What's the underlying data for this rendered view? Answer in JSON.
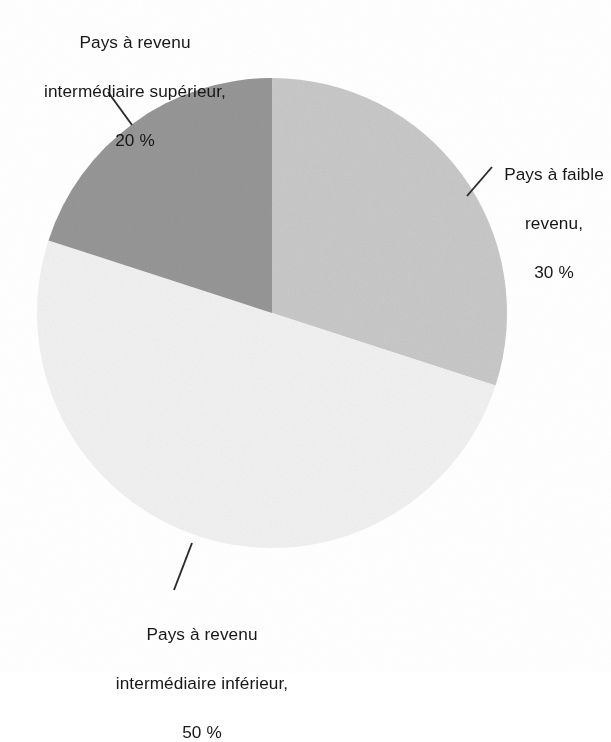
{
  "figure": {
    "type": "pie-chart",
    "background_color": "#ffffff",
    "text_color": "#171717"
  },
  "chart_data": {
    "type": "pie",
    "title": "",
    "subtitle": "",
    "xlabel": "",
    "ylabel": "",
    "legend_position": "none",
    "grid": false,
    "units": "%",
    "categories": [
      "Pays à faible revenu",
      "Pays à revenu intermédiaire inférieur",
      "Pays à revenu intermédiaire supérieur"
    ],
    "values": [
      30,
      50,
      20
    ],
    "labels": [
      "30 %",
      "50 %",
      "20 %"
    ],
    "colors": [
      "#bdbdbd",
      "#efefef",
      "#808080"
    ],
    "start_angle_deg": 0,
    "direction": "clockwise",
    "slices": [
      {
        "name": "low-income",
        "category": "Pays à faible revenu",
        "value": 30,
        "value_label": "30 %",
        "color": "#bdbdbd",
        "label_lines": [
          "Pays à faible",
          "revenu,",
          "30 %"
        ]
      },
      {
        "name": "lower-middle-income",
        "category": "Pays à revenu intermédiaire inférieur",
        "value": 50,
        "value_label": "50 %",
        "color": "#efefef",
        "label_lines": [
          "Pays à revenu",
          "intermédiaire inférieur,",
          "50 %"
        ]
      },
      {
        "name": "upper-middle-income",
        "category": "Pays à revenu intermédiaire supérieur",
        "value": 20,
        "value_label": "20 %",
        "color": "#808080",
        "label_lines": [
          "Pays à revenu",
          "intermédiaire supérieur,",
          "20 %"
        ]
      }
    ]
  },
  "labels": {
    "upper_middle_income": {
      "line1": "Pays à revenu",
      "line2": "intermédiaire supérieur,",
      "line3": "20 %"
    },
    "low_income": {
      "line1": "Pays à faible",
      "line2": "revenu,",
      "line3": "30 %"
    },
    "lower_middle_income": {
      "line1": "Pays à revenu",
      "line2": "intermédiaire inférieur,",
      "line3": "50 %"
    }
  }
}
